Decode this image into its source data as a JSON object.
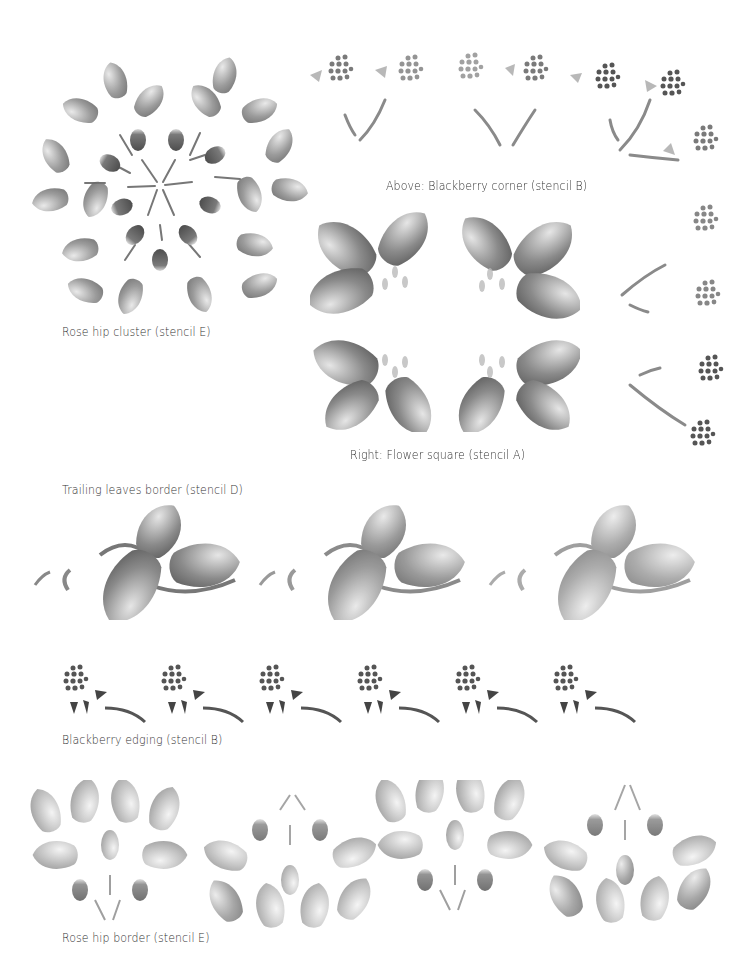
{
  "page": {
    "background": "#ffffff",
    "ink_color": "#6e6e6e"
  },
  "captions": {
    "rose_hip_cluster": "Rose hip cluster (stencil E)",
    "blackberry_corner": "Above: Blackberry corner (stencil B)",
    "flower_square": "Right: Flower square (stencil A)",
    "trailing_leaves": "Trailing leaves border (stencil D)",
    "blackberry_edging": "Blackberry edging (stencil B)",
    "rose_hip_border": "Rose hip border (stencil E)"
  },
  "motifs": {
    "rose_hip_cluster": {
      "stencil": "E",
      "hips": 9,
      "leaves": 18
    },
    "blackberry_corner": {
      "stencil": "B",
      "clusters_top": 6,
      "clusters_right": 5
    },
    "flower_square": {
      "stencil": "A",
      "quadrants": 4
    },
    "trailing_leaves": {
      "stencil": "D",
      "repeats": 3
    },
    "blackberry_edging": {
      "stencil": "B",
      "repeats": 6
    },
    "rose_hip_border": {
      "stencil": "E",
      "repeats": 4
    }
  }
}
